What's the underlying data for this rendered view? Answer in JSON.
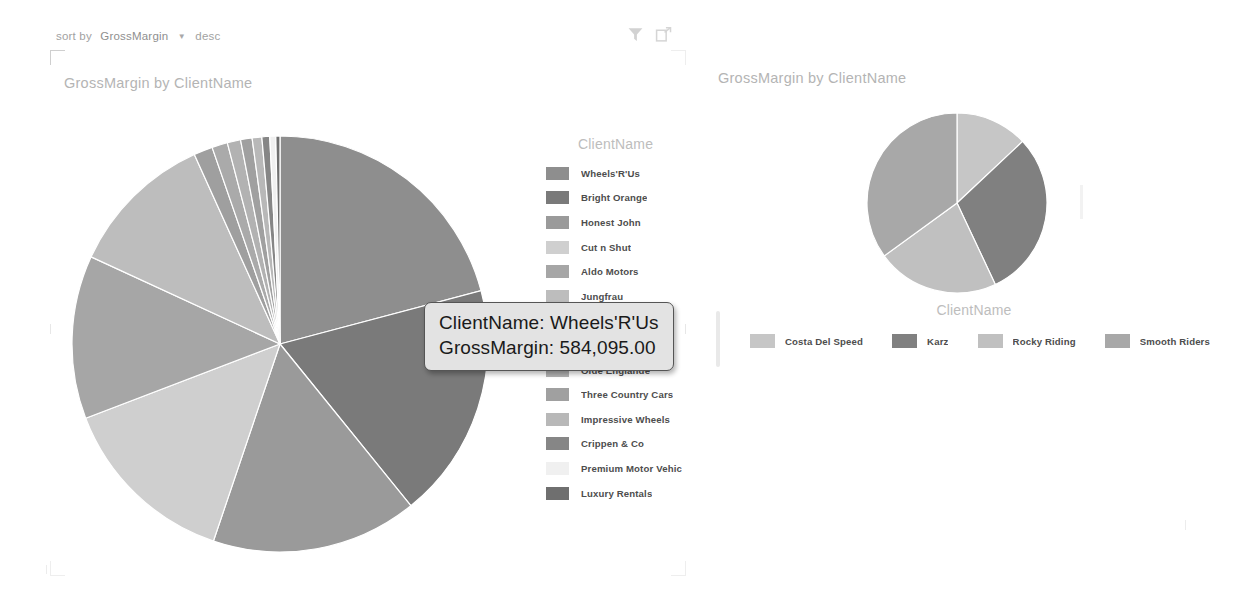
{
  "left_tile": {
    "sort_bar": {
      "label": "sort by",
      "field": "GrossMargin",
      "caret_icon": "chevron-down-icon",
      "direction": "desc"
    },
    "actions": [
      {
        "name": "filter-icon",
        "label": "Filter"
      },
      {
        "name": "focus-mode-icon",
        "label": "Focus mode"
      }
    ],
    "title": "GrossMargin by ClientName",
    "legend_title": "ClientName"
  },
  "right_tile": {
    "title": "GrossMargin by ClientName",
    "legend_title": "ClientName"
  },
  "tooltip": {
    "line1": "ClientName: Wheels'R'Us",
    "line2": "GrossMargin: 584,095.00"
  },
  "chart_data": [
    {
      "type": "pie",
      "title": "GrossMargin by ClientName",
      "legend_title": "ClientName",
      "legend_position": "right",
      "value_label": "GrossMargin",
      "category_label": "ClientName",
      "highlighted": "Wheels'R'Us",
      "highlighted_value": "584,095.00",
      "categories": [
        "Wheels'R'Us",
        "Bright Orange",
        "Honest John",
        "Cut n Shut",
        "Aldo Motors",
        "Jungfrau",
        "Chateau Mo",
        "Carosse Des Pages",
        "Olde Englande",
        "Three Country Cars",
        "Impressive Wheels",
        "Crippen & Co",
        "Premium Motor Vehic",
        "Luxury Rentals"
      ],
      "values": [
        584095,
        512000,
        448000,
        392000,
        355000,
        318000,
        41000,
        34000,
        29000,
        25000,
        21000,
        17000,
        13000,
        9000
      ],
      "colors": [
        "#8e8e8e",
        "#7a7a7a",
        "#9a9a9a",
        "#cfcfcf",
        "#a6a6a6",
        "#bdbdbd",
        "#9f9f9f",
        "#aaaaaa",
        "#b2b2b2",
        "#a0a0a0",
        "#b8b8b8",
        "#868686",
        "#f0f0f0",
        "#6f6f6f"
      ]
    },
    {
      "type": "pie",
      "title": "GrossMargin by ClientName",
      "legend_title": "ClientName",
      "legend_position": "bottom",
      "value_label": "GrossMargin",
      "category_label": "ClientName",
      "categories": [
        "Costa Del Speed",
        "Karz",
        "Rocky Riding",
        "Smooth Riders"
      ],
      "values": [
        13,
        30,
        22,
        35
      ],
      "colors": [
        "#c6c6c6",
        "#808080",
        "#c0c0c0",
        "#a8a8a8"
      ]
    }
  ]
}
